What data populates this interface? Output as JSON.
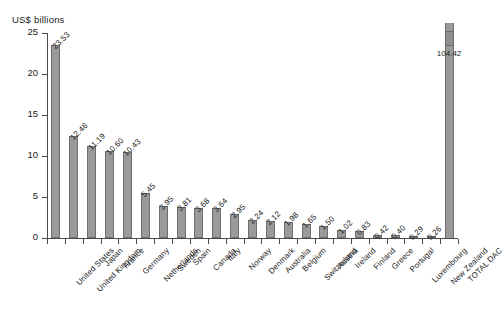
{
  "chart_data": {
    "type": "bar",
    "title": "",
    "subtitle": "",
    "xlabel": "",
    "ylabel": "US$ billions",
    "ylim": [
      0,
      25
    ],
    "yticks": [
      0,
      5,
      10,
      15,
      20,
      25
    ],
    "grid": false,
    "legend": null,
    "note": "Final category TOTAL DAC is drawn with a broken axis; its bar is truncated and a detached stub appears above the plot.",
    "categories": [
      "United States",
      "United Kingdom",
      "Japan",
      "France",
      "Germany",
      "Netherlands",
      "Sweden",
      "Spain",
      "Canada",
      "Italy",
      "Norway",
      "Denmark",
      "Australia",
      "Belgium",
      "Switzerland",
      "Austria",
      "Ireland",
      "Finland",
      "Greece",
      "Portugal",
      "Luxembourg",
      "New Zealand",
      "TOTAL DAC"
    ],
    "values": [
      23.53,
      12.46,
      11.19,
      10.6,
      10.43,
      5.45,
      3.95,
      3.81,
      3.68,
      3.64,
      2.95,
      2.24,
      2.12,
      1.98,
      1.65,
      1.5,
      1.02,
      0.83,
      0.42,
      0.4,
      0.29,
      0.26,
      104.42
    ],
    "value_labels": [
      "23.53",
      "12.46",
      "11.19",
      "10.60",
      "10.43",
      "5.45",
      "3.95",
      "3.81",
      "3.68",
      "3.64",
      "2.95",
      "2.24",
      "2.12",
      "1.98",
      "1.65",
      "1.50",
      "1.02",
      "0.83",
      "0.42",
      "0.40",
      "0.29",
      "0.26",
      "104.42"
    ],
    "colors": {
      "bar_fill": "#9a9a9a",
      "bar_stroke": "#6f6f6f",
      "axis": "#4a4a4a",
      "text": "#222222",
      "background": "#ffffff"
    }
  }
}
